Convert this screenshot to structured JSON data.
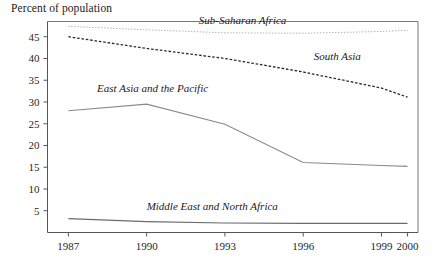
{
  "chart_data": {
    "type": "line",
    "title": "Percent of population",
    "xlabel": "",
    "ylabel": "",
    "grid": false,
    "legend_position": "inline-annotations",
    "x": [
      1987,
      1990,
      1993,
      1996,
      1999,
      2000
    ],
    "xtick_labels": [
      "1987",
      "1990",
      "1993",
      "1996",
      "1999",
      "2000"
    ],
    "ytick_labels": [
      "5",
      "10",
      "15",
      "20",
      "25",
      "30",
      "35",
      "40",
      "45"
    ],
    "ytick_values": [
      5,
      10,
      15,
      20,
      25,
      30,
      35,
      40,
      45
    ],
    "xlim": [
      1986.2,
      2000.4
    ],
    "ylim": [
      0,
      48.5
    ],
    "series": [
      {
        "name": "Sub-Saharan Africa",
        "style": "dotted-light",
        "color": "#9b9b9b",
        "values": [
          47.4,
          46.6,
          45.9,
          45.8,
          46.2,
          46.5
        ],
        "label_x": 1992.0,
        "label_y": 48.0
      },
      {
        "name": "South Asia",
        "style": "dashed-dark",
        "color": "#2b2b2b",
        "values": [
          45.0,
          42.3,
          40.0,
          36.9,
          33.2,
          31.1
        ],
        "label_x": 1996.4,
        "label_y": 39.6
      },
      {
        "name": "East Asia and the Pacific",
        "style": "solid",
        "color": "#8a8a8a",
        "values": [
          28.0,
          29.5,
          24.9,
          16.1,
          15.4,
          15.2
        ],
        "label_x": 1988.1,
        "label_y": 32.4
      },
      {
        "name": "Middle East and North Africa",
        "style": "solid",
        "color": "#6a6a6a",
        "values": [
          3.2,
          2.5,
          2.2,
          2.1,
          2.1,
          2.1
        ],
        "label_x": 1990.0,
        "label_y": 5.2
      }
    ]
  }
}
